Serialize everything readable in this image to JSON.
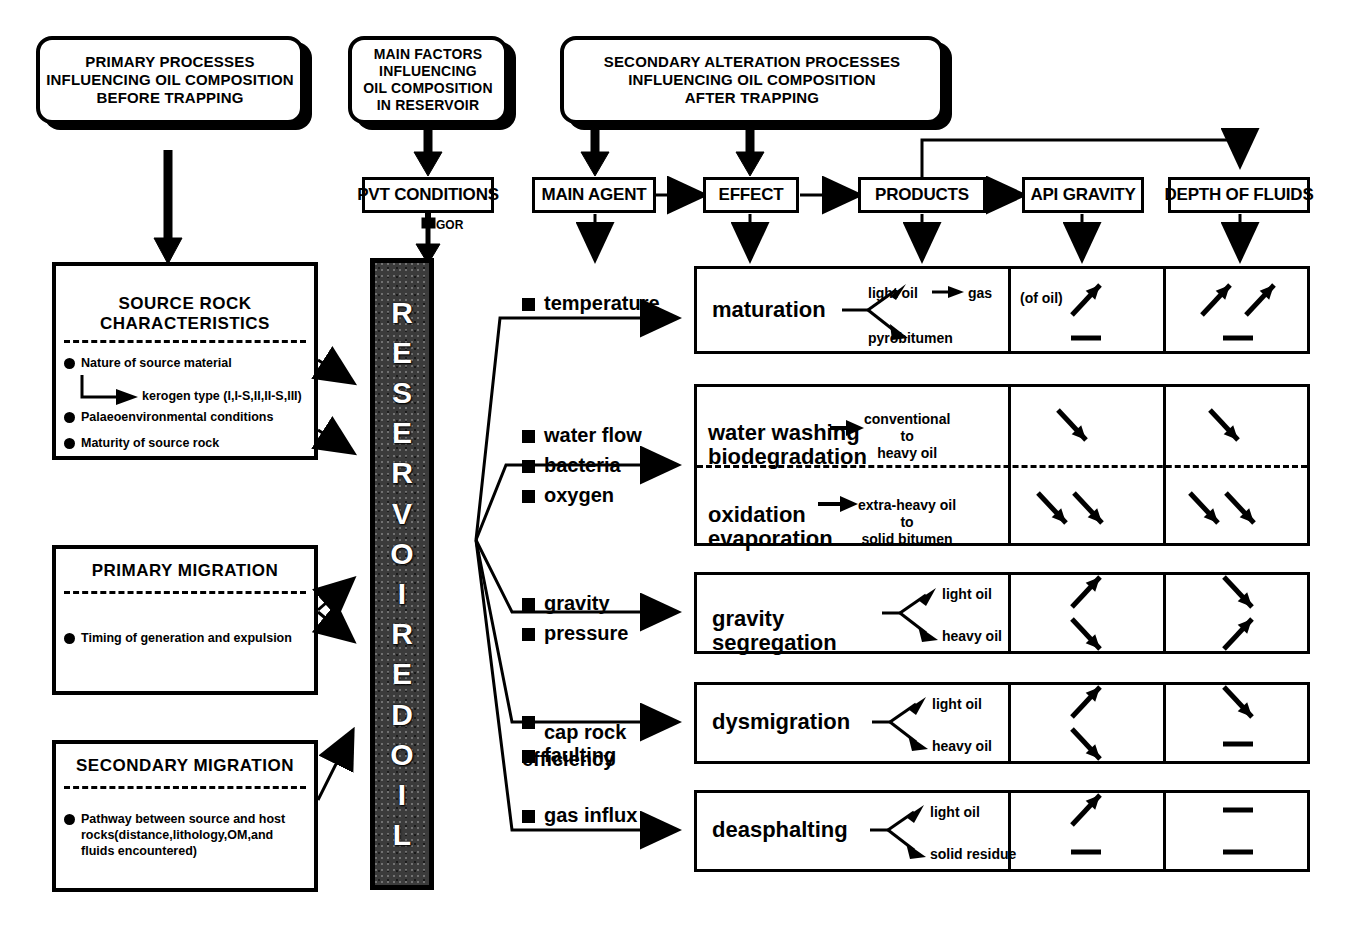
{
  "headers": {
    "primary": "PRIMARY PROCESSES\nINFLUENCING OIL COMPOSITION\nBEFORE TRAPPING",
    "main_factors": "MAIN FACTORS\nINFLUENCING\nOIL COMPOSITION\nIN RESERVOIR",
    "secondary": "SECONDARY ALTERATION PROCESSES\nINFLUENCING OIL COMPOSITION\nAFTER TRAPPING"
  },
  "column_headers": {
    "pvt": "PVT CONDITIONS",
    "gor": "GOR",
    "main_agent": "MAIN AGENT",
    "effect": "EFFECT",
    "products": "PRODUCTS",
    "api_gravity": "API GRAVITY",
    "depth": "DEPTH OF FLUIDS"
  },
  "reservoir": {
    "label": "RESERVOIRED OIL",
    "letters": [
      "R",
      "E",
      "S",
      "E",
      "R",
      "V",
      "O",
      "I",
      "R",
      "E",
      "D",
      "O",
      "I",
      "L"
    ]
  },
  "left_panels": [
    {
      "title": "SOURCE ROCK\nCHARACTERISTICS",
      "items": [
        {
          "text": "Nature of source material",
          "bullet": true
        },
        {
          "text": "kerogen type (I,I-S,II,II-S,III)",
          "bullet": false,
          "sub": true
        },
        {
          "text": "Palaeoenvironmental conditions",
          "bullet": true
        },
        {
          "text": "Maturity of source rock",
          "bullet": true
        }
      ]
    },
    {
      "title": "PRIMARY  MIGRATION",
      "items": [
        {
          "text": "Timing of generation and expulsion",
          "bullet": true
        }
      ]
    },
    {
      "title": "SECONDARY  MIGRATION",
      "items": [
        {
          "text": "Pathway between source and host\nrocks(distance,lithology,OM,and\nfluids encountered)",
          "bullet": true
        }
      ]
    }
  ],
  "rows": [
    {
      "agents": [
        "temperature"
      ],
      "effects": [
        {
          "name": "maturation",
          "products": [
            {
              "text": "light  oil",
              "then": "gas"
            },
            {
              "text": "pyrobitumen",
              "then": ""
            }
          ]
        }
      ],
      "api_gravity": {
        "note": "(of oil)",
        "marks": [
          "up"
        ],
        "marks2": [
          "dash"
        ]
      },
      "depth": {
        "note": "",
        "marks": [
          "up",
          "up"
        ],
        "marks2": [
          "dash"
        ]
      }
    },
    {
      "agents": [
        "water flow",
        "bacteria",
        "oxygen"
      ],
      "split": true,
      "effects": [
        {
          "name": "water washing\nbiodegradation",
          "result": "conventional\nto\nheavy oil"
        },
        {
          "name": "oxidation\nevaporation",
          "result": "extra-heavy oil\nto\nsolid bitumen"
        }
      ],
      "api_gravity": {
        "top": [
          "down"
        ],
        "bottom": [
          "down",
          "down"
        ]
      },
      "depth": {
        "top": [
          "down"
        ],
        "bottom": [
          "down",
          "down"
        ]
      }
    },
    {
      "agents": [
        "gravity",
        "pressure"
      ],
      "effects": [
        {
          "name": "gravity\nsegregation",
          "products": [
            {
              "text": "light oil"
            },
            {
              "text": "heavy oil"
            }
          ]
        }
      ],
      "api_gravity": {
        "marks": [
          "up"
        ],
        "marks2": [
          "down"
        ]
      },
      "depth": {
        "marks": [
          "down"
        ],
        "marks2": [
          "up"
        ]
      }
    },
    {
      "agents": [
        "cap rock\nefficiency",
        "faulting"
      ],
      "effects": [
        {
          "name": "dysmigration",
          "products": [
            {
              "text": "light oil"
            },
            {
              "text": "heavy oil"
            }
          ]
        }
      ],
      "api_gravity": {
        "marks": [
          "up"
        ],
        "marks2": [
          "down"
        ]
      },
      "depth": {
        "marks": [
          "down"
        ],
        "marks2": [
          "dash"
        ]
      }
    },
    {
      "agents": [
        "gas influx"
      ],
      "effects": [
        {
          "name": "deasphalting",
          "products": [
            {
              "text": "light oil"
            },
            {
              "text": "solid residue"
            }
          ]
        }
      ],
      "api_gravity": {
        "marks": [
          "up"
        ],
        "marks2": [
          "dash"
        ]
      },
      "depth": {
        "marks": [
          "dash"
        ],
        "marks2": [
          "dash"
        ]
      }
    }
  ],
  "colors": {
    "ink": "#000000",
    "paper": "#ffffff",
    "reservoir_fill": "#3b3b3b"
  }
}
